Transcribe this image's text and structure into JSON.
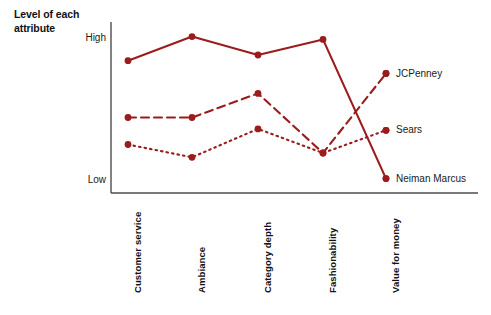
{
  "chart_data": {
    "type": "line",
    "title": "Level of each attribute",
    "xlabel": "",
    "ylabel": "Level of each attribute",
    "grid": false,
    "legend_position": "right",
    "ylim": [
      0,
      100
    ],
    "ytick_labels": [
      "Low",
      "High"
    ],
    "categories": [
      "Customer service",
      "Ambiance",
      "Category depth",
      "Fashionability",
      "Value for money"
    ],
    "series": [
      {
        "name": "Neiman Marcus",
        "line_style": "solid",
        "color": "#9B1C1C",
        "values": [
          84,
          101,
          88,
          99,
          1
        ]
      },
      {
        "name": "JCPenney",
        "line_style": "dashed",
        "color": "#9B1C1C",
        "values": [
          44,
          44,
          61,
          19,
          75
        ]
      },
      {
        "name": "Sears",
        "line_style": "dotted",
        "color": "#9B1C1C",
        "values": [
          25,
          16,
          36,
          19,
          35
        ]
      }
    ]
  },
  "axis": {
    "title": "Level of each attribute",
    "high_label": "High",
    "low_label": "Low"
  },
  "categories": [
    {
      "label": "Customer service"
    },
    {
      "label": "Ambiance"
    },
    {
      "label": "Category depth"
    },
    {
      "label": "Fashionability"
    },
    {
      "label": "Value for money"
    }
  ],
  "legend": [
    {
      "label": "JCPenney"
    },
    {
      "label": "Sears"
    },
    {
      "label": "Neiman Marcus"
    }
  ],
  "colors": {
    "series": "#9B1C1C",
    "axis": "#4d4d4d",
    "text": "#1a1a1a"
  }
}
